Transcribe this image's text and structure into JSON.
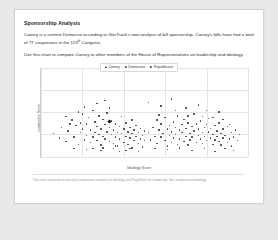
{
  "page": {
    "heading": "Sponsorship Analysis",
    "paragraph_1": "Carney is a centrist Democrat according to GovTrack's own analysis of bill sponsorship. Carney's bills have had a total of 77 cosponsors in the 113",
    "paragraph_1_sup": "th",
    "paragraph_1_end": " Congress.",
    "paragraph_2": "Use this chart to compare Carney to other members of the House of Representatives on leadership and ideology.",
    "footer": "This chart is based on principal components analysis for ideology and PageRank for leadership. See analysis methodology."
  },
  "chart_data": {
    "type": "scatter",
    "title": "",
    "xlabel": "Ideology Score",
    "ylabel": "Leadership Score",
    "xlim": [
      0,
      1
    ],
    "ylim": [
      0,
      1
    ],
    "grid": true,
    "legend_position": "top-center",
    "legend": [
      {
        "name": "Carney",
        "marker": "triangle",
        "color": "#111111"
      },
      {
        "name": "Democrats",
        "marker": "circle",
        "color": "#34404d"
      },
      {
        "name": "Republicans",
        "marker": "circle",
        "color": "#34404d"
      }
    ],
    "xticks": [
      0.0,
      0.2,
      0.4,
      0.6,
      0.8,
      1.0
    ],
    "yticks": [
      0.0,
      0.25,
      0.5,
      0.75,
      1.0
    ],
    "highlight": {
      "name": "Carney",
      "x": 0.33,
      "y": 0.4
    },
    "series": [
      {
        "name": "Democrats",
        "color": "#34404d",
        "points": [
          [
            0.06,
            0.26
          ],
          [
            0.09,
            0.21
          ],
          [
            0.1,
            0.33
          ],
          [
            0.12,
            0.17
          ],
          [
            0.13,
            0.29
          ],
          [
            0.15,
            0.41
          ],
          [
            0.16,
            0.22
          ],
          [
            0.17,
            0.35
          ],
          [
            0.18,
            0.14
          ],
          [
            0.19,
            0.27
          ],
          [
            0.2,
            0.48
          ],
          [
            0.2,
            0.31
          ],
          [
            0.21,
            0.19
          ],
          [
            0.22,
            0.37
          ],
          [
            0.22,
            0.24
          ],
          [
            0.23,
            0.44
          ],
          [
            0.24,
            0.16
          ],
          [
            0.24,
            0.3
          ],
          [
            0.25,
            0.52
          ],
          [
            0.25,
            0.22
          ],
          [
            0.26,
            0.39
          ],
          [
            0.26,
            0.27
          ],
          [
            0.27,
            0.18
          ],
          [
            0.27,
            0.34
          ],
          [
            0.28,
            0.46
          ],
          [
            0.28,
            0.25
          ],
          [
            0.29,
            0.31
          ],
          [
            0.29,
            0.13
          ],
          [
            0.3,
            0.42
          ],
          [
            0.3,
            0.23
          ],
          [
            0.31,
            0.36
          ],
          [
            0.31,
            0.2
          ],
          [
            0.32,
            0.28
          ],
          [
            0.32,
            0.49
          ],
          [
            0.33,
            0.17
          ],
          [
            0.33,
            0.33
          ],
          [
            0.34,
            0.25
          ],
          [
            0.34,
            0.4
          ],
          [
            0.35,
            0.15
          ],
          [
            0.35,
            0.3
          ],
          [
            0.36,
            0.22
          ],
          [
            0.36,
            0.37
          ],
          [
            0.37,
            0.27
          ],
          [
            0.37,
            0.12
          ],
          [
            0.38,
            0.34
          ],
          [
            0.38,
            0.2
          ],
          [
            0.39,
            0.45
          ],
          [
            0.39,
            0.26
          ],
          [
            0.4,
            0.31
          ],
          [
            0.4,
            0.16
          ],
          [
            0.41,
            0.23
          ],
          [
            0.41,
            0.38
          ],
          [
            0.42,
            0.28
          ],
          [
            0.42,
            0.14
          ],
          [
            0.43,
            0.33
          ],
          [
            0.43,
            0.21
          ],
          [
            0.44,
            0.26
          ],
          [
            0.44,
            0.41
          ],
          [
            0.45,
            0.18
          ],
          [
            0.45,
            0.3
          ],
          [
            0.46,
            0.23
          ],
          [
            0.46,
            0.35
          ],
          [
            0.47,
            0.15
          ],
          [
            0.47,
            0.27
          ],
          [
            0.48,
            0.2
          ],
          [
            0.48,
            0.32
          ],
          [
            0.49,
            0.24
          ],
          [
            0.49,
            0.11
          ],
          [
            0.5,
            0.29
          ],
          [
            0.5,
            0.18
          ],
          [
            0.21,
            0.56
          ],
          [
            0.27,
            0.6
          ],
          [
            0.33,
            0.55
          ],
          [
            0.16,
            0.09
          ],
          [
            0.22,
            0.08
          ],
          [
            0.29,
            0.07
          ],
          [
            0.35,
            0.09
          ],
          [
            0.41,
            0.07
          ],
          [
            0.44,
            0.1
          ],
          [
            0.38,
            0.06
          ],
          [
            0.12,
            0.45
          ],
          [
            0.14,
            0.37
          ],
          [
            0.18,
            0.5
          ],
          [
            0.31,
            0.63
          ],
          [
            0.25,
            0.09
          ],
          [
            0.3,
            0.1
          ],
          [
            0.36,
            0.12
          ],
          [
            0.43,
            0.09
          ],
          [
            0.47,
            0.06
          ],
          [
            0.19,
            0.38
          ]
        ]
      },
      {
        "name": "Republicans",
        "color": "#34404d",
        "points": [
          [
            0.52,
            0.27
          ],
          [
            0.53,
            0.19
          ],
          [
            0.54,
            0.33
          ],
          [
            0.55,
            0.23
          ],
          [
            0.56,
            0.41
          ],
          [
            0.56,
            0.15
          ],
          [
            0.57,
            0.3
          ],
          [
            0.58,
            0.22
          ],
          [
            0.58,
            0.37
          ],
          [
            0.59,
            0.26
          ],
          [
            0.6,
            0.18
          ],
          [
            0.6,
            0.44
          ],
          [
            0.61,
            0.31
          ],
          [
            0.61,
            0.12
          ],
          [
            0.62,
            0.35
          ],
          [
            0.62,
            0.24
          ],
          [
            0.63,
            0.28
          ],
          [
            0.63,
            0.16
          ],
          [
            0.64,
            0.39
          ],
          [
            0.64,
            0.21
          ],
          [
            0.65,
            0.33
          ],
          [
            0.65,
            0.25
          ],
          [
            0.66,
            0.46
          ],
          [
            0.66,
            0.14
          ],
          [
            0.67,
            0.3
          ],
          [
            0.67,
            0.2
          ],
          [
            0.68,
            0.36
          ],
          [
            0.68,
            0.27
          ],
          [
            0.69,
            0.17
          ],
          [
            0.69,
            0.42
          ],
          [
            0.7,
            0.23
          ],
          [
            0.7,
            0.32
          ],
          [
            0.71,
            0.13
          ],
          [
            0.71,
            0.38
          ],
          [
            0.72,
            0.26
          ],
          [
            0.72,
            0.19
          ],
          [
            0.73,
            0.34
          ],
          [
            0.73,
            0.22
          ],
          [
            0.74,
            0.48
          ],
          [
            0.74,
            0.29
          ],
          [
            0.75,
            0.16
          ],
          [
            0.75,
            0.37
          ],
          [
            0.76,
            0.24
          ],
          [
            0.76,
            0.31
          ],
          [
            0.77,
            0.2
          ],
          [
            0.77,
            0.4
          ],
          [
            0.78,
            0.27
          ],
          [
            0.78,
            0.15
          ],
          [
            0.79,
            0.33
          ],
          [
            0.79,
            0.23
          ],
          [
            0.8,
            0.36
          ],
          [
            0.8,
            0.18
          ],
          [
            0.81,
            0.28
          ],
          [
            0.81,
            0.43
          ],
          [
            0.82,
            0.21
          ],
          [
            0.82,
            0.32
          ],
          [
            0.83,
            0.25
          ],
          [
            0.83,
            0.14
          ],
          [
            0.84,
            0.35
          ],
          [
            0.84,
            0.19
          ],
          [
            0.85,
            0.29
          ],
          [
            0.85,
            0.23
          ],
          [
            0.86,
            0.17
          ],
          [
            0.86,
            0.38
          ],
          [
            0.87,
            0.26
          ],
          [
            0.87,
            0.13
          ],
          [
            0.88,
            0.31
          ],
          [
            0.88,
            0.21
          ],
          [
            0.89,
            0.24
          ],
          [
            0.9,
            0.16
          ],
          [
            0.9,
            0.34
          ],
          [
            0.91,
            0.2
          ],
          [
            0.92,
            0.27
          ],
          [
            0.92,
            0.12
          ],
          [
            0.93,
            0.22
          ],
          [
            0.94,
            0.3
          ],
          [
            0.95,
            0.18
          ],
          [
            0.96,
            0.25
          ],
          [
            0.52,
            0.61
          ],
          [
            0.58,
            0.57
          ],
          [
            0.63,
            0.65
          ],
          [
            0.7,
            0.55
          ],
          [
            0.76,
            0.58
          ],
          [
            0.8,
            0.52
          ],
          [
            0.86,
            0.5
          ],
          [
            0.55,
            0.09
          ],
          [
            0.61,
            0.08
          ],
          [
            0.67,
            0.1
          ],
          [
            0.73,
            0.07
          ],
          [
            0.79,
            0.09
          ],
          [
            0.84,
            0.06
          ],
          [
            0.89,
            0.09
          ],
          [
            0.93,
            0.07
          ],
          [
            0.57,
            0.47
          ],
          [
            0.65,
            0.52
          ],
          [
            0.71,
            0.46
          ],
          [
            0.78,
            0.45
          ],
          [
            0.83,
            0.44
          ],
          [
            0.88,
            0.42
          ],
          [
            0.91,
            0.36
          ]
        ]
      }
    ]
  }
}
